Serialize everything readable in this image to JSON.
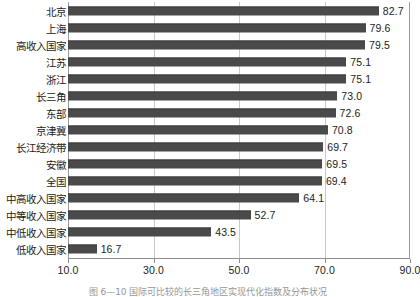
{
  "chart_data": {
    "type": "bar",
    "orientation": "horizontal",
    "title": "",
    "xlabel": "",
    "ylabel": "",
    "xlim": [
      10.0,
      90.0
    ],
    "xticks": [
      "10.0",
      "30.0",
      "50.0",
      "70.0",
      "90.0"
    ],
    "xtick_values": [
      10.0,
      30.0,
      50.0,
      70.0,
      90.0
    ],
    "grid": "vertical",
    "legend": "none",
    "bar_color": "#4a4a4a",
    "categories": [
      "北京",
      "上海",
      "高收入国家",
      "江苏",
      "浙江",
      "长三角",
      "东部",
      "京津冀",
      "长江经济带",
      "安徽",
      "全国",
      "中高收入国家",
      "中等收入国家",
      "中低收入国家",
      "低收入国家"
    ],
    "values": [
      82.7,
      79.6,
      79.5,
      75.1,
      75.1,
      73.0,
      72.6,
      70.8,
      69.7,
      69.5,
      69.4,
      64.1,
      52.7,
      43.5,
      16.7
    ],
    "value_labels": [
      "82.7",
      "79.6",
      "79.5",
      "75.1",
      "75.1",
      "73.0",
      "72.6",
      "70.8",
      "69.7",
      "69.5",
      "69.4",
      "64.1",
      "52.7",
      "43.5",
      "16.7"
    ]
  },
  "caption": {
    "text": "图 6—10  国际可比较的长三角地区实现代化指数及分布状况"
  }
}
